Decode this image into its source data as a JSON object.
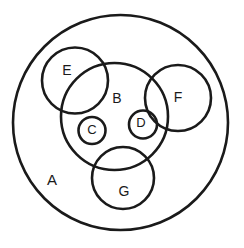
{
  "diagram": {
    "type": "venn-nested-circles",
    "background_color": "#ffffff",
    "stroke_color": "#1a1a1a",
    "canvas": {
      "width": 244,
      "height": 248
    },
    "circles": [
      {
        "id": "A",
        "label": "A",
        "cx": 120.5,
        "cy": 122.5,
        "r": 107.5,
        "stroke_width": 2.6,
        "label_x": 52,
        "label_y": 181,
        "font_size": 15
      },
      {
        "id": "B",
        "label": "B",
        "cx": 114.5,
        "cy": 116.5,
        "r": 53.5,
        "stroke_width": 2.6,
        "label_x": 117,
        "label_y": 99,
        "font_size": 14
      },
      {
        "id": "E",
        "label": "E",
        "cx": 75,
        "cy": 80.5,
        "r": 33,
        "stroke_width": 2.6,
        "label_x": 67,
        "label_y": 71,
        "font_size": 14
      },
      {
        "id": "F",
        "label": "F",
        "cx": 178,
        "cy": 98,
        "r": 33,
        "stroke_width": 2.6,
        "label_x": 178,
        "label_y": 98,
        "font_size": 14
      },
      {
        "id": "C",
        "label": "C",
        "cx": 92,
        "cy": 130.5,
        "r": 13.5,
        "stroke_width": 2.6,
        "label_x": 92,
        "label_y": 131,
        "font_size": 13
      },
      {
        "id": "D",
        "label": "D",
        "cx": 143,
        "cy": 124.5,
        "r": 14,
        "stroke_width": 2.6,
        "label_x": 141,
        "label_y": 124,
        "font_size": 13
      },
      {
        "id": "G",
        "label": "G",
        "cx": 123,
        "cy": 178,
        "r": 31,
        "stroke_width": 2.6,
        "label_x": 124,
        "label_y": 192,
        "font_size": 14
      }
    ]
  }
}
